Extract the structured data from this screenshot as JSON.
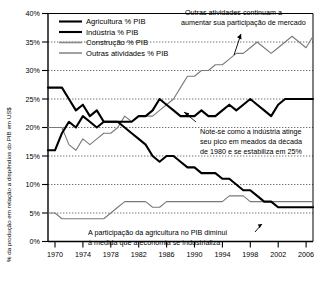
{
  "chart_data": {
    "type": "line",
    "title": "",
    "xlabel": "",
    "ylabel": "% da produção em relação a dispêndios do PIB em US$",
    "xlim": [
      1970,
      2008
    ],
    "ylim": [
      0,
      40
    ],
    "grid": true,
    "grid_axis": "y",
    "legend_position": "top-left",
    "x": [
      1970,
      1971,
      1972,
      1973,
      1974,
      1975,
      1976,
      1977,
      1978,
      1979,
      1980,
      1981,
      1982,
      1983,
      1984,
      1985,
      1986,
      1987,
      1988,
      1989,
      1990,
      1991,
      1992,
      1993,
      1994,
      1995,
      1996,
      1997,
      1998,
      1999,
      2000,
      2001,
      2002,
      2003,
      2004,
      2005,
      2006,
      2007,
      2008
    ],
    "xticks": [
      1970,
      1974,
      1978,
      1982,
      1986,
      1990,
      1994,
      1998,
      2002,
      2006
    ],
    "yticks": [
      0,
      5,
      10,
      15,
      20,
      25,
      30,
      35,
      40
    ],
    "ytick_labels": [
      "0%",
      "5%",
      "10%",
      "15%",
      "20%",
      "25%",
      "30%",
      "35%",
      "40%"
    ],
    "series": [
      {
        "name": "Agricultura % PIB",
        "style": "thick-black",
        "color": "#000000",
        "values": [
          27,
          27,
          27,
          25,
          23,
          24,
          22,
          23,
          21,
          21,
          21,
          20,
          19,
          18,
          17,
          15,
          14,
          15,
          15,
          14,
          13,
          13,
          12,
          12,
          12,
          11,
          11,
          10,
          9,
          9,
          8,
          7,
          7,
          6,
          6,
          6,
          6,
          6,
          6
        ]
      },
      {
        "name": "Indústria % PIB",
        "style": "thick-black",
        "color": "#000000",
        "values": [
          16,
          16,
          19,
          21,
          20,
          22,
          21,
          20,
          21,
          21,
          21,
          21,
          21,
          22,
          22,
          23,
          25,
          24,
          23,
          22,
          22,
          22,
          23,
          22,
          22,
          23,
          24,
          23,
          24,
          25,
          24,
          23,
          22,
          24,
          25,
          25,
          25,
          25,
          25
        ]
      },
      {
        "name": "Construção % PIB",
        "style": "thin-gray",
        "color": "#555555",
        "values": [
          5,
          5,
          4,
          4,
          4,
          4,
          4,
          4,
          4,
          5,
          6,
          7,
          7,
          7,
          7,
          6,
          6,
          7,
          7,
          7,
          7,
          7,
          7,
          7,
          7,
          7,
          8,
          8,
          8,
          7,
          7,
          7,
          7,
          7,
          7,
          7,
          7,
          7,
          7
        ]
      },
      {
        "name": "Outras atividades % PIB",
        "style": "thin-gray",
        "color": "#555555",
        "values": [
          20,
          20,
          20,
          17,
          16,
          18,
          17,
          18,
          19,
          19,
          20,
          22,
          21,
          22,
          22,
          22,
          23,
          24,
          25,
          27,
          29,
          29,
          30,
          30,
          31,
          31,
          32,
          33,
          33,
          34,
          35,
          34,
          33,
          34,
          35,
          36,
          35,
          34,
          36
        ]
      }
    ],
    "annotations": [
      {
        "id": "outras-annotation",
        "lines": [
          "Outras atividades continuam a",
          "aumentar sua participação de mercado"
        ]
      },
      {
        "id": "industria-annotation",
        "lines": [
          "Note-se como a indústria atinge",
          "seu pico em meados da década",
          "de 1980 e se estabiliza em 25%"
        ]
      },
      {
        "id": "agricultura-annotation",
        "lines": [
          "A participação da agricultura no PIB diminui",
          "à medida que a economia se industrializa"
        ]
      }
    ]
  },
  "axis": {
    "y_title": "% da produção em relação a dispêndios do PIB em US$",
    "y_labels": [
      "40%",
      "35%",
      "30%",
      "25%",
      "20%",
      "15%",
      "10%",
      "5%",
      "0%"
    ],
    "x_labels": [
      "1970",
      "1974",
      "1978",
      "1982",
      "1986",
      "1990",
      "1994",
      "1998",
      "2002",
      "2006"
    ]
  },
  "legend": {
    "items": [
      {
        "label": "Agricultura % PIB"
      },
      {
        "label": "Indústria % PIB"
      },
      {
        "label": "Construção % PIB"
      },
      {
        "label": "Outras atividades % PIB"
      }
    ]
  },
  "annotations": {
    "top": {
      "line1": "Outras atividades continuam a",
      "line2": "aumentar sua participação de mercado"
    },
    "middle": {
      "line1": "Note-se como a indústria atinge",
      "line2": "seu pico em meados da década",
      "line3": "de 1980 e se estabiliza em 25%"
    },
    "bottom": {
      "line1": "A participação da agricultura no PIB diminui",
      "line2": "à medida que a economia se industrializa"
    }
  },
  "colors": {
    "thick_line": "#000000",
    "thin_line": "#555555",
    "grid": "#333333",
    "axis": "#000000",
    "background": "#ffffff"
  }
}
